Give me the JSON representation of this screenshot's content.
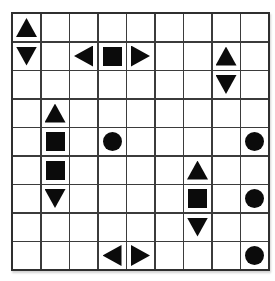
{
  "app": {
    "description": "shape placement puzzle board"
  },
  "colors": {
    "shape": "#0b0b0b",
    "grid_line": "#3b3b3b",
    "grid_border": "#2f2f2f",
    "cell_bg": "#ffffff",
    "page_bg": "#ffffff"
  },
  "grid": {
    "rows": 9,
    "cols": 9,
    "shape_types": [
      "triangle-up",
      "triangle-down",
      "triangle-left",
      "triangle-right",
      "square",
      "circle"
    ],
    "placements": [
      {
        "row": 1,
        "col": 1,
        "shape": "triangle-up"
      },
      {
        "row": 2,
        "col": 1,
        "shape": "triangle-down"
      },
      {
        "row": 2,
        "col": 3,
        "shape": "triangle-left"
      },
      {
        "row": 2,
        "col": 4,
        "shape": "square"
      },
      {
        "row": 2,
        "col": 5,
        "shape": "triangle-right"
      },
      {
        "row": 2,
        "col": 8,
        "shape": "triangle-up"
      },
      {
        "row": 3,
        "col": 8,
        "shape": "triangle-down"
      },
      {
        "row": 4,
        "col": 2,
        "shape": "triangle-up"
      },
      {
        "row": 5,
        "col": 2,
        "shape": "square"
      },
      {
        "row": 5,
        "col": 4,
        "shape": "circle"
      },
      {
        "row": 5,
        "col": 9,
        "shape": "circle"
      },
      {
        "row": 6,
        "col": 2,
        "shape": "square"
      },
      {
        "row": 6,
        "col": 7,
        "shape": "triangle-up"
      },
      {
        "row": 7,
        "col": 2,
        "shape": "triangle-down"
      },
      {
        "row": 7,
        "col": 7,
        "shape": "square"
      },
      {
        "row": 7,
        "col": 9,
        "shape": "circle"
      },
      {
        "row": 8,
        "col": 7,
        "shape": "triangle-down"
      },
      {
        "row": 9,
        "col": 4,
        "shape": "triangle-left"
      },
      {
        "row": 9,
        "col": 5,
        "shape": "triangle-right"
      },
      {
        "row": 9,
        "col": 9,
        "shape": "circle"
      }
    ]
  }
}
